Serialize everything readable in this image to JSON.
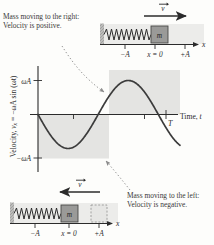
{
  "figure": {
    "captions": {
      "top": "Mass moving to the right: Velocity is positive.",
      "bottom": "Mass moving to the left: Velocity is negative."
    }
  },
  "axes": {
    "y_label_full": "Velocity, vx = −ωA sin (ωt)",
    "y_label_prefix": "Velocity, ",
    "y_label_var": "v",
    "y_label_sub": "x",
    "y_label_eq": " = −ωA sin (ωt)",
    "x_label_prefix": "Time, ",
    "x_label_var": "t",
    "y_ticks": [
      "ωA",
      "−ωA"
    ],
    "y_tick_values": [
      1,
      -1
    ],
    "x_tick_label": "T",
    "x_minor_ticks": [
      "",
      ""
    ]
  },
  "chart_data": {
    "type": "line",
    "xlabel": "Time, t",
    "ylabel": "Velocity, vx = −ωA sin (ωt)",
    "xlim": [
      0,
      1.18
    ],
    "ylim": [
      -1.35,
      1.35
    ],
    "grid": false,
    "legend": null,
    "x_unit": "periods (T)",
    "series": [
      {
        "name": "vx = −ωA sin(ωt)",
        "x": [
          0,
          0.05,
          0.1,
          0.15,
          0.2,
          0.25,
          0.3,
          0.35,
          0.4,
          0.45,
          0.5,
          0.55,
          0.6,
          0.65,
          0.7,
          0.75,
          0.8,
          0.85,
          0.9,
          0.95,
          1.0,
          1.05,
          1.1,
          1.15
        ],
        "y": [
          0,
          -0.309,
          -0.588,
          -0.809,
          -0.951,
          -1.0,
          -0.951,
          -0.809,
          -0.588,
          -0.309,
          0,
          0.309,
          0.588,
          0.809,
          0.951,
          1.0,
          0.951,
          0.809,
          0.588,
          0.309,
          0,
          -0.309,
          -0.588,
          -0.809
        ]
      }
    ],
    "annotations": [
      {
        "text": "Mass moving to the right: Velocity is positive.",
        "points_to_x": 0.62,
        "points_to_y": 0.62,
        "region": "positive"
      },
      {
        "text": "Mass moving to the left: Velocity is negative.",
        "points_to_x": 0.37,
        "points_to_y": -0.72,
        "region": "negative"
      }
    ],
    "shaded_bands": [
      {
        "name": "negative-half-band",
        "x_from": 0,
        "x_to": 0.5,
        "y_from": -1.1,
        "y_to": 0
      },
      {
        "name": "positive-half-band",
        "x_from": 0.5,
        "x_to": 1.0,
        "y_from": 0,
        "y_to": 1.1
      }
    ]
  },
  "diagram_top": {
    "name": "mass-spring-moving-right",
    "mass_label": "m",
    "velocity_label": "v",
    "axis_label": "x",
    "position_labels": [
      "−A",
      "x = 0",
      "+A"
    ],
    "velocity_direction": "right",
    "mass_position": "x = 0"
  },
  "diagram_bottom": {
    "name": "mass-spring-moving-left",
    "mass_label": "m",
    "velocity_label": "v",
    "axis_label": "x",
    "position_labels": [
      "−A",
      "x = 0",
      "+A"
    ],
    "velocity_direction": "left",
    "mass_position": "x = 0",
    "ghost_block_position": "+A"
  },
  "colors": {
    "curve": "#3b3b3b",
    "axis": "#2b2b2b",
    "band": "#e2e2e0",
    "block": "#8d8d8d",
    "floor": "#b9b9b7",
    "leader": "#8a8a8a",
    "text": "#3a3a3a"
  }
}
